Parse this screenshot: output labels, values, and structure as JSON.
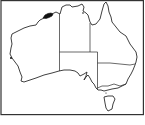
{
  "map": {
    "subject": "Australia",
    "regions": [
      "Western Australia",
      "Northern Territory",
      "South Australia",
      "Queensland",
      "New South Wales",
      "Victoria",
      "Tasmania"
    ],
    "highlighted_area": {
      "location": "Kimberley coast, northern Western Australia",
      "color": "#111111"
    },
    "outline_color": "#2a2a2a",
    "background_color": "#ffffff"
  }
}
